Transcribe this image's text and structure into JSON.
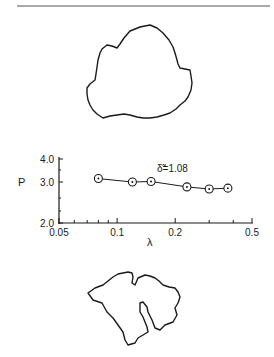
{
  "figure": {
    "top_shape": {
      "name": "upper-outline",
      "points": [
        [
          150,
          25
        ],
        [
          140,
          27
        ],
        [
          130,
          31
        ],
        [
          124,
          38
        ],
        [
          120,
          44
        ],
        [
          117,
          48
        ],
        [
          112,
          46
        ],
        [
          107,
          45
        ],
        [
          102,
          49
        ],
        [
          100,
          53
        ],
        [
          98,
          60
        ],
        [
          97,
          67
        ],
        [
          96,
          74
        ],
        [
          95,
          80
        ],
        [
          90,
          84
        ],
        [
          87,
          88
        ],
        [
          87,
          94
        ],
        [
          88,
          100
        ],
        [
          90,
          105
        ],
        [
          93,
          110
        ],
        [
          97,
          114
        ],
        [
          103,
          118
        ],
        [
          110,
          116
        ],
        [
          117,
          115
        ],
        [
          124,
          114
        ],
        [
          130,
          115
        ],
        [
          137,
          117
        ],
        [
          143,
          118
        ],
        [
          150,
          118
        ],
        [
          157,
          117
        ],
        [
          164,
          115
        ],
        [
          170,
          113
        ],
        [
          176,
          109
        ],
        [
          180,
          105
        ],
        [
          185,
          101
        ],
        [
          188,
          97
        ],
        [
          191,
          90
        ],
        [
          192,
          83
        ],
        [
          191,
          76
        ],
        [
          190,
          70
        ],
        [
          185,
          69
        ],
        [
          180,
          68
        ],
        [
          178,
          64
        ],
        [
          177,
          60
        ],
        [
          175,
          53
        ],
        [
          173,
          47
        ],
        [
          169,
          40
        ],
        [
          163,
          33
        ],
        [
          157,
          28
        ]
      ]
    },
    "bottom_shape": {
      "name": "lower-outline",
      "points": [
        [
          88,
          293
        ],
        [
          95,
          288
        ],
        [
          103,
          285
        ],
        [
          108,
          281
        ],
        [
          113,
          277
        ],
        [
          118,
          274
        ],
        [
          123,
          273
        ],
        [
          128,
          272
        ],
        [
          132,
          273
        ],
        [
          133,
          277
        ],
        [
          132,
          283
        ],
        [
          135,
          285
        ],
        [
          138,
          278
        ],
        [
          145,
          275
        ],
        [
          150,
          276
        ],
        [
          155,
          278
        ],
        [
          159,
          281
        ],
        [
          163,
          285
        ],
        [
          169,
          287
        ],
        [
          175,
          288
        ],
        [
          178,
          292
        ],
        [
          180,
          297
        ],
        [
          178,
          303
        ],
        [
          175,
          308
        ],
        [
          177,
          315
        ],
        [
          173,
          322
        ],
        [
          165,
          325
        ],
        [
          160,
          330
        ],
        [
          155,
          328
        ],
        [
          152,
          320
        ],
        [
          148,
          312
        ],
        [
          147,
          307
        ],
        [
          143,
          302
        ],
        [
          140,
          303
        ],
        [
          140,
          312
        ],
        [
          143,
          317
        ],
        [
          145,
          322
        ],
        [
          147,
          327
        ],
        [
          148,
          332
        ],
        [
          143,
          335
        ],
        [
          138,
          338
        ],
        [
          135,
          343
        ],
        [
          128,
          345
        ],
        [
          125,
          340
        ],
        [
          123,
          332
        ],
        [
          118,
          325
        ],
        [
          113,
          318
        ],
        [
          107,
          312
        ],
        [
          102,
          303
        ],
        [
          93,
          300
        ],
        [
          88,
          293
        ]
      ]
    },
    "annotation": "δ̃=1.08"
  },
  "chart_data": {
    "type": "line",
    "title": "",
    "xlabel": "λ",
    "ylabel": "P",
    "xscale": "log",
    "xlim": [
      0.05,
      0.5
    ],
    "ylim": [
      2.0,
      4.0
    ],
    "x_ticks": [
      "0.05",
      "0.1",
      "0.2",
      "0.5"
    ],
    "y_ticks": [
      "2.0",
      "3.0",
      "4.0"
    ],
    "grid": false,
    "marker": "circled-dot",
    "annotation": "δ̃=1.08",
    "series": [
      {
        "name": "δ̃=1.08",
        "x": [
          0.08,
          0.12,
          0.15,
          0.23,
          0.3,
          0.375
        ],
        "y": [
          3.15,
          3.0,
          3.02,
          2.88,
          2.83,
          2.85
        ]
      }
    ]
  }
}
